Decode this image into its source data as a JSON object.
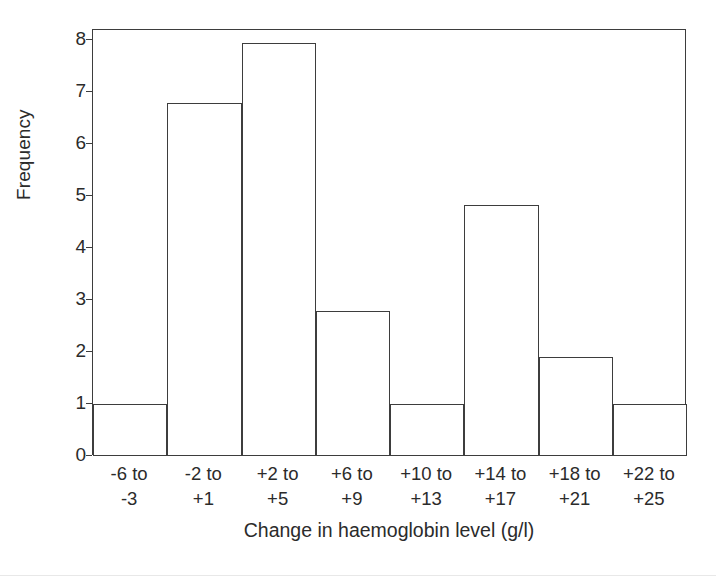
{
  "chart_data": {
    "type": "bar",
    "title": "",
    "subtitle": "",
    "xlabel": "Change in haemoglobin level (g/l)",
    "ylabel": "Frequency",
    "categories": [
      "-6 to\n-3",
      "-2 to\n+1",
      "+2 to\n+5",
      "+6 to\n+9",
      "+10 to\n+13",
      "+14 to\n+17",
      "+18 to\n+21",
      "+22 to\n+25"
    ],
    "category_lines": [
      {
        "line1": "-6 to",
        "line2": "-3"
      },
      {
        "line1": "-2 to",
        "line2": "+1"
      },
      {
        "line1": "+2 to",
        "line2": "+5"
      },
      {
        "line1": "+6 to",
        "line2": "+9"
      },
      {
        "line1": "+10 to",
        "line2": "+13"
      },
      {
        "line1": "+14 to",
        "line2": "+17"
      },
      {
        "line1": "+18 to",
        "line2": "+21"
      },
      {
        "line1": "+22 to",
        "line2": "+25"
      }
    ],
    "values": [
      1,
      6.8,
      7.95,
      2.8,
      1,
      4.83,
      1.9,
      1
    ],
    "ylim": [
      0,
      8.2
    ],
    "yticks": [
      0,
      1,
      2,
      3,
      4,
      5,
      6,
      7,
      8
    ],
    "ytick_labels": [
      "0",
      "1",
      "2",
      "3",
      "4",
      "5",
      "6",
      "7",
      "8"
    ],
    "xlim": [
      0,
      8
    ],
    "grid": false,
    "legend": null,
    "bar_style": {
      "fill": "#ffffff",
      "stroke": "#3d3d3d",
      "stroke_width": 1,
      "contiguous": true
    },
    "frame": {
      "visible": true,
      "color": "#3d3d3d"
    }
  }
}
